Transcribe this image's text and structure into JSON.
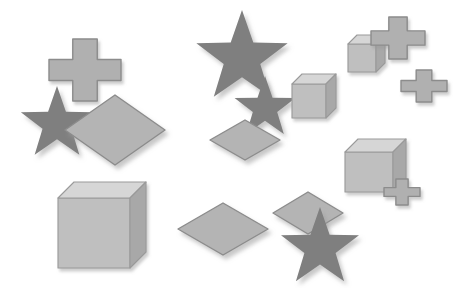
{
  "canvas": {
    "width": 468,
    "height": 288,
    "background": "#ffffff",
    "description": "Synthetic 3D shape scene with grey cubes, stars, diamonds and cross shapes"
  },
  "palette": {
    "star_fill": "#7f7f7f",
    "cross_fill": "#b0b0b0",
    "cross_stroke": "#8c8c8c",
    "diamond_fill": "#b4b4b4",
    "diamond_stroke": "#8c8c8c",
    "cube_top": "#d6d6d6",
    "cube_front": "#bfbfbf",
    "cube_side": "#a8a8a8",
    "cube_stroke": "#9a9a9a",
    "shadow": "#c8c8c8"
  },
  "shapes": [
    {
      "id": 1,
      "name": "cross-top-left",
      "type": "cross",
      "cx": 85,
      "cy": 70,
      "w": 72,
      "h": 62,
      "rot": 0
    },
    {
      "id": 2,
      "name": "star-left",
      "type": "star",
      "cx": 57,
      "cy": 124,
      "r": 38,
      "rot": 0
    },
    {
      "id": 3,
      "name": "diamond-large-left",
      "type": "diamond",
      "cx": 115,
      "cy": 130,
      "w": 100,
      "h": 70,
      "rot": 0
    },
    {
      "id": 4,
      "name": "cube-bottom-left",
      "type": "cube",
      "x": 58,
      "y": 198,
      "w": 72,
      "h": 70,
      "d": 16
    },
    {
      "id": 5,
      "name": "star-large-center",
      "type": "star",
      "cx": 242,
      "cy": 58,
      "r": 48,
      "rot": 0
    },
    {
      "id": 6,
      "name": "star-small-center",
      "type": "star",
      "cx": 265,
      "cy": 108,
      "r": 32,
      "rot": 0
    },
    {
      "id": 7,
      "name": "cube-center",
      "type": "cube",
      "x": 292,
      "y": 84,
      "w": 34,
      "h": 34,
      "d": 10
    },
    {
      "id": 8,
      "name": "diamond-center",
      "type": "diamond",
      "cx": 245,
      "cy": 140,
      "w": 70,
      "h": 40,
      "rot": 0
    },
    {
      "id": 9,
      "name": "diamond-bottom-center",
      "type": "diamond",
      "cx": 223,
      "cy": 229,
      "w": 90,
      "h": 52,
      "rot": 0
    },
    {
      "id": 10,
      "name": "diamond-bottom-right",
      "type": "diamond",
      "cx": 308,
      "cy": 213,
      "w": 70,
      "h": 42,
      "rot": 0
    },
    {
      "id": 11,
      "name": "star-bottom-right",
      "type": "star",
      "cx": 320,
      "cy": 248,
      "r": 41,
      "rot": 0
    },
    {
      "id": 12,
      "name": "cube-top-right",
      "type": "cube",
      "x": 348,
      "y": 44,
      "w": 28,
      "h": 28,
      "d": 9
    },
    {
      "id": 13,
      "name": "cross-top-right",
      "type": "cross",
      "cx": 398,
      "cy": 38,
      "w": 54,
      "h": 42,
      "rot": 0
    },
    {
      "id": 14,
      "name": "cross-right",
      "type": "cross",
      "cx": 424,
      "cy": 86,
      "w": 46,
      "h": 32,
      "rot": 0
    },
    {
      "id": 15,
      "name": "cube-right",
      "type": "cube",
      "x": 345,
      "y": 152,
      "w": 48,
      "h": 40,
      "d": 13
    },
    {
      "id": 16,
      "name": "cross-small-right",
      "type": "cross",
      "cx": 402,
      "cy": 192,
      "w": 36,
      "h": 26,
      "rot": 0
    }
  ]
}
